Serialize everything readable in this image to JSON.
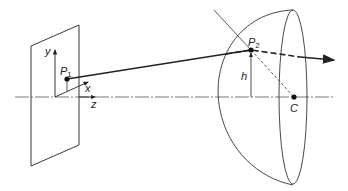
{
  "diagram": {
    "labels": {
      "y_axis": "y",
      "x_axis": "x",
      "z_axis": "z",
      "p1": "P",
      "p1_sub": "1",
      "p2": "P",
      "p2_sub": "2",
      "height": "h",
      "center": "C"
    },
    "colors": {
      "line": "#222222",
      "background": "#ffffff"
    }
  }
}
